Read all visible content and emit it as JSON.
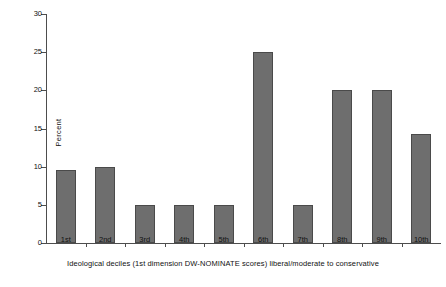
{
  "chart_data": {
    "type": "bar",
    "title": "",
    "subtitle": "",
    "xlabel": "Ideological deciles (1st dimension DW-NOMINATE scores) liberal/moderate to conservative",
    "ylabel": "Percent",
    "categories": [
      "1st",
      "2nd",
      "3rd",
      "4th",
      "5th",
      "6th",
      "7th",
      "8th",
      "9th",
      "10th"
    ],
    "values": [
      9.5,
      10,
      5,
      5,
      5,
      25,
      5,
      20,
      20,
      14.3
    ],
    "ylim": [
      0,
      30
    ],
    "yticks": [
      0,
      5,
      10,
      15,
      20,
      25,
      30
    ],
    "ytick_labels": [
      "0",
      "5",
      "10",
      "15",
      "20",
      "25",
      "30"
    ],
    "grid": false,
    "legend": "none",
    "bar_color": "#6e6e6e",
    "bar_edge_color": "#4a4a4a",
    "axis_color": "#4d4d4d",
    "background": "#ffffff"
  }
}
